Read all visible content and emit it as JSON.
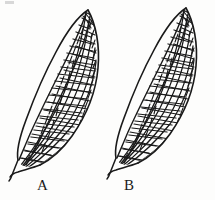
{
  "figure": {
    "background_color": "#fdfdfc",
    "ink_color": "#1a1a1a",
    "panels": [
      {
        "label": "A",
        "label_x": 37,
        "label_y": 178,
        "description": "Left forewing, line drawing showing costal margin crossveins and reticulate cell network"
      },
      {
        "label": "B",
        "label_x": 124,
        "label_y": 178,
        "description": "Right forewing, line drawing showing costal margin crossveins and reticulate cell network"
      }
    ]
  },
  "labels": {
    "panel_a": "A",
    "panel_b": "B"
  }
}
